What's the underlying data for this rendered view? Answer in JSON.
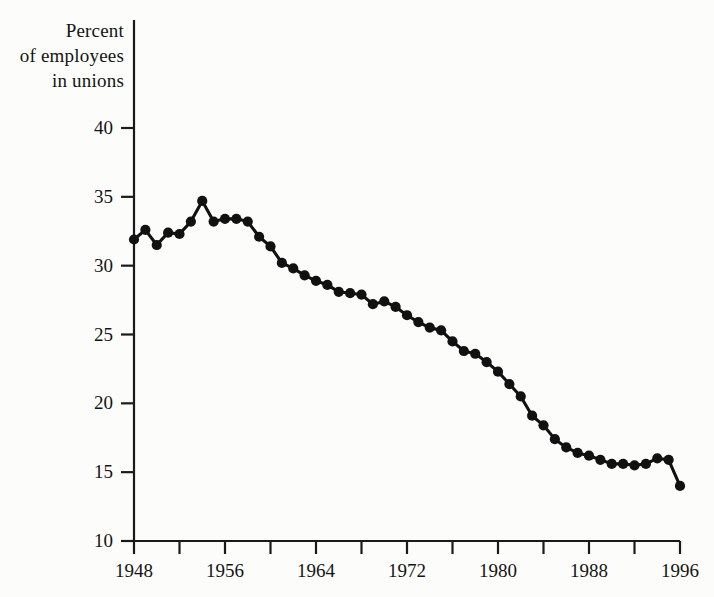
{
  "chart_data": {
    "type": "line",
    "title": "Percent of employees in unions",
    "title_lines": [
      "Percent",
      "of employees",
      "in unions"
    ],
    "xlabel": "",
    "ylabel": "Percent of employees in unions",
    "xlim": [
      1948,
      1996
    ],
    "ylim": [
      10,
      40
    ],
    "grid": false,
    "legend": null,
    "marker": "filled-circle",
    "line_color": "#111111",
    "marker_color": "#111111",
    "background_color": "#fcfcfb",
    "y_ticks": [
      10,
      15,
      20,
      25,
      30,
      35,
      40
    ],
    "y_tick_labels": [
      "10",
      "15",
      "20",
      "25",
      "30",
      "35",
      "40"
    ],
    "x_ticks": [
      1948,
      1952,
      1956,
      1960,
      1964,
      1968,
      1972,
      1976,
      1980,
      1984,
      1988,
      1992,
      1996
    ],
    "x_tick_labels_shown": [
      "1948",
      "1956",
      "1964",
      "1972",
      "1980",
      "1988",
      "1996"
    ],
    "x_labeled_ticks": [
      1948,
      1956,
      1964,
      1972,
      1980,
      1988,
      1996
    ],
    "x": [
      1948,
      1949,
      1950,
      1951,
      1952,
      1953,
      1954,
      1955,
      1956,
      1957,
      1958,
      1959,
      1960,
      1961,
      1962,
      1963,
      1964,
      1965,
      1966,
      1967,
      1968,
      1969,
      1970,
      1971,
      1972,
      1973,
      1974,
      1975,
      1976,
      1977,
      1978,
      1979,
      1980,
      1981,
      1982,
      1983,
      1984,
      1985,
      1986,
      1987,
      1988,
      1989,
      1990,
      1991,
      1992,
      1993,
      1994,
      1995,
      1996
    ],
    "values": [
      31.9,
      32.6,
      31.5,
      32.4,
      32.3,
      33.2,
      34.7,
      33.2,
      33.4,
      33.4,
      33.2,
      32.1,
      31.4,
      30.2,
      29.8,
      29.3,
      28.9,
      28.6,
      28.1,
      28.0,
      27.9,
      27.2,
      27.4,
      27.0,
      26.4,
      25.9,
      25.5,
      25.3,
      24.5,
      23.8,
      23.6,
      23.0,
      22.3,
      21.4,
      20.5,
      19.1,
      18.4,
      17.4,
      16.8,
      16.4,
      16.2,
      15.9,
      15.6,
      15.6,
      15.5,
      15.6,
      16.0,
      15.9,
      14.0
    ]
  },
  "axes": {
    "axis_line_color": "#1a1a1a",
    "tick_direction": "out"
  }
}
